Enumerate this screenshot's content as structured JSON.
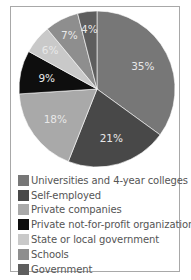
{
  "chart_data": {
    "type": "pie",
    "title": "",
    "categories": [
      "Universities and 4-year colleges",
      "Self-employed",
      "Private companies",
      "Private not-for-profit organizations",
      "State or local government",
      "Schools",
      "Government"
    ],
    "values": [
      35,
      21,
      18,
      9,
      6,
      7,
      4
    ],
    "value_labels": [
      "35%",
      "21%",
      "18%",
      "9%",
      "6%",
      "7%",
      "4%"
    ],
    "colors": [
      "#777777",
      "#484848",
      "#a9a9a9",
      "#0e0e0e",
      "#c9c9c9",
      "#8e8e8e",
      "#5e5e5e"
    ],
    "start_angle": "12 o'clock",
    "direction": "clockwise",
    "legend_position": "bottom"
  }
}
